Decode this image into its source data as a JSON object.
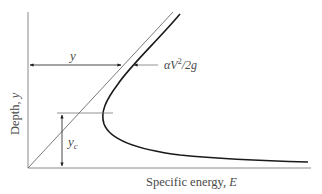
{
  "diagram": {
    "x_axis_label": "Specific energy, E",
    "y_axis_label": "Depth, y",
    "labels": {
      "depth": "y",
      "velocity_head": "αV²/2g",
      "velocity_head_main": "αV",
      "velocity_head_sup": "2",
      "velocity_head_tail": "/2g",
      "critical_depth_main": "y",
      "critical_depth_sub": "c"
    },
    "elements": [
      {
        "id": "y-axis",
        "type": "axis"
      },
      {
        "id": "x-axis",
        "type": "axis"
      },
      {
        "id": "line-45",
        "type": "line",
        "meaning": "E = y"
      },
      {
        "id": "specific-energy-curve",
        "type": "curve",
        "meaning": "E = y + αV²/2g"
      },
      {
        "id": "depth-dimension",
        "type": "dimension-arrow",
        "label": "y"
      },
      {
        "id": "velocity-head-dimension",
        "type": "dimension-arrow",
        "label": "αV²/2g"
      },
      {
        "id": "critical-depth-dimension",
        "type": "dimension-arrow",
        "label": "y_c"
      }
    ],
    "colors": {
      "axis": "#8a8a8a",
      "curve": "#1a1a1a",
      "guide": "#777777",
      "text": "#4a4a4a"
    }
  }
}
